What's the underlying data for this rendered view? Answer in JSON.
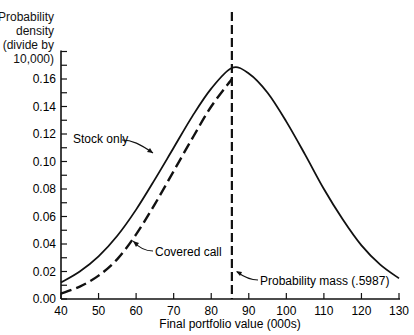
{
  "chart_data": {
    "type": "line",
    "title": "",
    "ylabel_lines": [
      "Probability",
      "density",
      "(divide by",
      "10,000)"
    ],
    "xlabel": "Final portfolio value (000s)",
    "xlim": [
      40,
      130
    ],
    "ylim": [
      0,
      0.18
    ],
    "x_ticks": [
      40,
      50,
      60,
      70,
      80,
      90,
      100,
      110,
      120,
      130
    ],
    "y_ticks": [
      "0.00",
      "0.02",
      "0.04",
      "0.06",
      "0.08",
      "0.10",
      "0.12",
      "0.14",
      "0.16"
    ],
    "grid": false,
    "series": [
      {
        "name": "Stock only",
        "style": "solid",
        "x": [
          40,
          45,
          50,
          55,
          60,
          65,
          70,
          75,
          80,
          85.5,
          90,
          95,
          100,
          105,
          110,
          115,
          120,
          125,
          130
        ],
        "values": [
          0.012,
          0.02,
          0.031,
          0.046,
          0.065,
          0.087,
          0.11,
          0.133,
          0.153,
          0.168,
          0.164,
          0.15,
          0.129,
          0.105,
          0.08,
          0.058,
          0.039,
          0.025,
          0.015
        ]
      },
      {
        "name": "Covered call",
        "style": "dashed",
        "x": [
          40,
          45,
          50,
          55,
          60,
          65,
          70,
          75,
          80,
          85.5
        ],
        "values": [
          0.004,
          0.009,
          0.017,
          0.029,
          0.047,
          0.069,
          0.093,
          0.117,
          0.14,
          0.16
        ]
      }
    ],
    "vertical_line": {
      "x": 85.5,
      "style": "dashed"
    },
    "annotations": [
      {
        "text": "Stock only",
        "points_to": "Stock only curve"
      },
      {
        "text": "Covered call",
        "points_to": "Covered call curve"
      },
      {
        "text": "Probability mass (.5987)",
        "points_to": "vertical dashed line at x=85.5"
      }
    ]
  },
  "labels": {
    "ylabel": [
      "Probability",
      "density",
      "(divide by",
      "10,000)"
    ],
    "xlabel": "Final portfolio value (000s)",
    "stock_only": "Stock only",
    "covered_call": "Covered call",
    "prob_mass": "Probability mass (.5987)"
  }
}
